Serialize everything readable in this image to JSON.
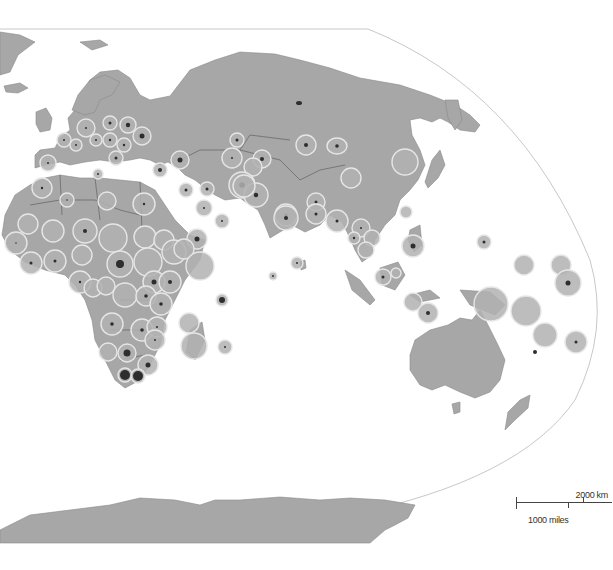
{
  "map": {
    "projection_frame": "curved-right-edge",
    "colors": {
      "land": "#a7a7a7",
      "bubble": "#b2b2b2",
      "bubble_outline": "#e6e6e6",
      "dot": "#2e2e2e",
      "background": "#ffffff"
    },
    "regions_shown": [
      "Europe",
      "Africa",
      "Asia",
      "Oceania",
      "Antarctica"
    ]
  },
  "scale_bar": {
    "km_label": "2000 km",
    "miles_label": "1000 miles"
  }
}
